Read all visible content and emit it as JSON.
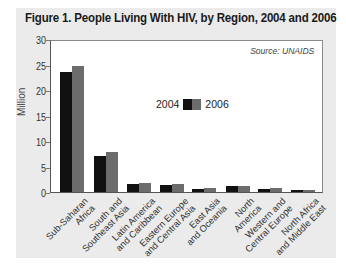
{
  "chart_data": {
    "type": "bar",
    "title": "Figure  1. People Living With HIV, by Region, 2004 and 2006",
    "source": "Source: UNAIDS",
    "xlabel": "",
    "ylabel": "Million",
    "ylim": [
      0,
      30
    ],
    "yticks": [
      0,
      5,
      10,
      15,
      20,
      25,
      30
    ],
    "grid": false,
    "legend_position": "inside-center",
    "categories": [
      "Sub-Saharan Africa",
      "South and Southeast Asia",
      "Latin America and Caribbean",
      "Eastern Europe and Central Asia",
      "East Asia and Oceania",
      "North America",
      "Western and Central Europe",
      "North Africa and Middle East"
    ],
    "category_lines": [
      [
        "Sub-Saharan",
        "Africa"
      ],
      [
        "South and",
        "Southeast Asia"
      ],
      [
        "Latin America",
        "and Caribbean"
      ],
      [
        "Eastern Europe",
        "and Central Asia"
      ],
      [
        "East Asia",
        "and Oceania"
      ],
      [
        "North",
        "America"
      ],
      [
        "Western and",
        "Central Europe"
      ],
      [
        "North Africa",
        "and Middle East"
      ]
    ],
    "series": [
      {
        "name": "2004",
        "color": "#111111",
        "values": [
          23.6,
          7.1,
          1.6,
          1.3,
          0.6,
          1.1,
          0.6,
          0.35
        ]
      },
      {
        "name": "2006",
        "color": "#6c6c6c",
        "values": [
          24.7,
          7.8,
          1.7,
          1.5,
          0.75,
          1.2,
          0.7,
          0.45
        ]
      }
    ]
  },
  "legend": {
    "label_2004": "2004",
    "label_2006": "2006"
  },
  "yaxis": {
    "label": "Million",
    "ticks": [
      "0",
      "5",
      "10",
      "15",
      "20",
      "25",
      "30"
    ]
  }
}
